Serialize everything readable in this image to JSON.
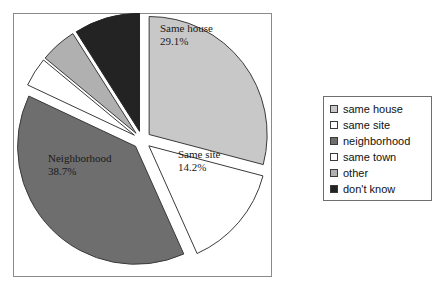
{
  "chart_data": {
    "type": "pie",
    "title": "",
    "categories": [
      "same house",
      "same site",
      "neighborhood",
      "same town",
      "other",
      "don't know"
    ],
    "values": [
      29.1,
      14.2,
      38.7,
      4.0,
      5.0,
      9.0
    ],
    "value_unit": "%",
    "start_angle_deg": 0,
    "direction": "clockwise",
    "exploded": true,
    "legend_position": "right",
    "grid": false,
    "slices": [
      {
        "label": "same house",
        "display_label": "Same house",
        "value": 29.1,
        "value_text": "29.1%",
        "color": "#c8c8c8",
        "edge_color": "#3a3a3a",
        "labeled_on_chart": true
      },
      {
        "label": "same site",
        "display_label": "Same site",
        "value": 14.2,
        "value_text": "14.2%",
        "color": "#ffffff",
        "edge_color": "#3a3a3a",
        "labeled_on_chart": true
      },
      {
        "label": "neighborhood",
        "display_label": "Neighborhood",
        "value": 38.7,
        "value_text": "38.7%",
        "color": "#6e6e6e",
        "edge_color": "#3a3a3a",
        "labeled_on_chart": true
      },
      {
        "label": "same town",
        "display_label": "same town",
        "value": 4.0,
        "value_text": "",
        "color": "#ffffff",
        "edge_color": "#3a3a3a",
        "labeled_on_chart": false
      },
      {
        "label": "other",
        "display_label": "other",
        "value": 5.0,
        "value_text": "",
        "color": "#b0b0b0",
        "edge_color": "#3a3a3a",
        "labeled_on_chart": false
      },
      {
        "label": "don't know",
        "display_label": "don't know",
        "value": 9.0,
        "value_text": "",
        "color": "#232323",
        "edge_color": "#232323",
        "labeled_on_chart": false
      }
    ],
    "chart_labels": [
      {
        "name": "Same house",
        "percent": "29.1%"
      },
      {
        "name": "Same site",
        "percent": "14.2%"
      },
      {
        "name": "Neighborhood",
        "percent": "38.7%"
      }
    ]
  },
  "legend": {
    "items": [
      {
        "label": "same house",
        "color": "#c8c8c8"
      },
      {
        "label": "same site",
        "color": "#ffffff"
      },
      {
        "label": "neighborhood",
        "color": "#6e6e6e"
      },
      {
        "label": "same town",
        "color": "#ffffff"
      },
      {
        "label": "other",
        "color": "#b0b0b0"
      },
      {
        "label": "don't know",
        "color": "#232323"
      }
    ]
  },
  "colors": {
    "plot_border": "#8a8a8a",
    "legend_border": "#6e6e6e",
    "slice_outline": "#3a3a3a",
    "background": "#ffffff",
    "text": "#111111"
  }
}
